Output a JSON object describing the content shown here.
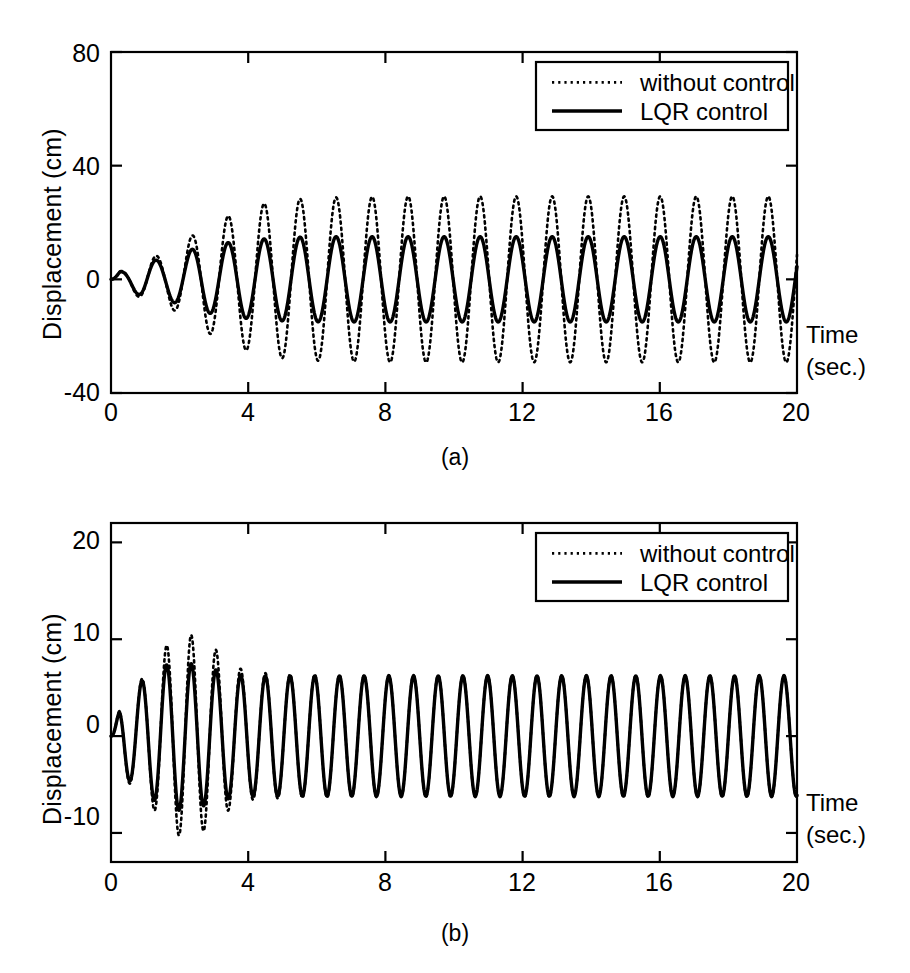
{
  "figure": {
    "panels": [
      {
        "id": "a",
        "caption": "(a)",
        "ylabel": "Displacement (cm)",
        "xlabel_line1": "Time",
        "xlabel_line2": "(sec.)",
        "yticks": [
          "80",
          "40",
          "0",
          "-40"
        ],
        "xticks": [
          "0",
          "4",
          "8",
          "12",
          "16",
          "20"
        ],
        "legend": [
          {
            "label": "without control",
            "style": "dotted"
          },
          {
            "label": "LQR control",
            "style": "solid"
          }
        ]
      },
      {
        "id": "b",
        "caption": "(b)",
        "ylabel": "Displacement (cm)",
        "xlabel_line1": "Time",
        "xlabel_line2": "(sec.)",
        "yticks": [
          "20",
          "10",
          "0",
          "-10"
        ],
        "xticks": [
          "0",
          "4",
          "8",
          "12",
          "16",
          "20"
        ],
        "legend": [
          {
            "label": "without control",
            "style": "dotted"
          },
          {
            "label": "LQR control",
            "style": "solid"
          }
        ]
      }
    ]
  },
  "colors": {
    "ink": "#000000",
    "background": "#ffffff"
  },
  "chart_data": [
    {
      "type": "line",
      "panel": "a",
      "title": "",
      "xlabel": "Time (sec.)",
      "ylabel": "Displacement (cm)",
      "xlim": [
        0,
        20
      ],
      "ylim": [
        -40,
        80
      ],
      "xticks": [
        0,
        4,
        8,
        12,
        16,
        20
      ],
      "yticks": [
        -40,
        0,
        40,
        80
      ],
      "grid": false,
      "legend_position": "top-right",
      "notes": "Top-floor displacement time history; dotted (uncontrolled) grows to a steady amplitude near 29 cm while solid (LQR controlled) saturates near 15 cm. Oscillation period about 1.05 s (~19 cycles in 20 s).",
      "series": [
        {
          "name": "without control",
          "style": "dotted",
          "period_sec": 1.05,
          "envelope_x": [
            0,
            0.5,
            1.0,
            1.6,
            2.1,
            2.6,
            3.2,
            3.7,
            4.2,
            4.8,
            5.3,
            6.3,
            7.4,
            8.4,
            10.5,
            12.6,
            14.7,
            16.8,
            20.0
          ],
          "envelope_amplitude": [
            1.5,
            4.0,
            7.5,
            9.0,
            13.0,
            17.5,
            21.0,
            24.0,
            26.0,
            27.5,
            28.2,
            28.8,
            29.0,
            29.2,
            29.2,
            29.2,
            29.2,
            29.2,
            29.2
          ],
          "peak_values_cm": [
            7.5,
            13.0,
            21.0,
            26.0,
            28.2,
            29.0,
            29.2,
            29.2,
            29.2,
            29.2,
            29.2,
            29.2,
            29.2,
            29.2,
            29.2,
            29.2,
            29.2,
            29.2,
            29.2
          ],
          "trough_values_cm": [
            -4.0,
            -9.0,
            -17.5,
            -24.0,
            -27.5,
            -28.8,
            -29.0,
            -29.2,
            -29.2,
            -29.2,
            -29.2,
            -29.2,
            -29.2,
            -29.2,
            -29.2,
            -29.2,
            -29.2,
            -29.2
          ],
          "steady_state_amplitude_cm": 29.2
        },
        {
          "name": "LQR control",
          "style": "solid",
          "period_sec": 1.05,
          "envelope_x": [
            0,
            0.5,
            1.0,
            1.6,
            2.1,
            2.6,
            3.2,
            3.7,
            4.2,
            4.8,
            5.3,
            6.3,
            7.4,
            8.4,
            10.5,
            12.6,
            14.7,
            16.8,
            20.0
          ],
          "envelope_amplitude": [
            1.5,
            3.5,
            6.5,
            7.0,
            9.5,
            11.5,
            12.5,
            13.5,
            14.0,
            14.5,
            14.8,
            15.0,
            15.0,
            15.0,
            15.0,
            15.0,
            15.0,
            15.0,
            15.0
          ],
          "peak_values_cm": [
            6.5,
            9.5,
            12.5,
            14.0,
            14.8,
            15.0,
            15.0,
            15.0,
            15.0,
            15.0,
            15.0,
            15.0,
            15.0,
            15.0,
            15.0,
            15.0,
            15.0,
            15.0,
            15.0
          ],
          "trough_values_cm": [
            -3.5,
            -7.0,
            -11.5,
            -13.5,
            -14.5,
            -15.0,
            -15.0,
            -15.0,
            -15.0,
            -15.0,
            -15.0,
            -15.0,
            -15.0,
            -15.0,
            -15.0,
            -15.0,
            -15.0,
            -15.0
          ],
          "steady_state_amplitude_cm": 15.0
        }
      ]
    },
    {
      "type": "line",
      "panel": "b",
      "title": "",
      "xlabel": "Time (sec.)",
      "ylabel": "Displacement (cm)",
      "xlim": [
        0,
        20
      ],
      "ylim": [
        -13,
        22
      ],
      "xticks": [
        0,
        4,
        8,
        12,
        16,
        20
      ],
      "yticks": [
        -10,
        0,
        10,
        20
      ],
      "grid": false,
      "legend_position": "top-right",
      "notes": "Base/first-floor displacement; dotted (uncontrolled) overshoots to about 10 cm near t=1.8-2.6 s then settles to about 6.3 cm, nearly coincident with the solid LQR curve which peaks near 7.7 cm and settles near 6.2 cm. Period about 0.72 s (~28 cycles in 20 s).",
      "series": [
        {
          "name": "without control",
          "style": "dotted",
          "period_sec": 0.72,
          "envelope_x": [
            0,
            0.4,
            1.0,
            1.5,
            1.9,
            2.3,
            2.7,
            3.1,
            3.5,
            4.0,
            5.0,
            7.0,
            10.0,
            14.0,
            20.0
          ],
          "envelope_amplitude": [
            1.0,
            4.5,
            6.2,
            9.0,
            10.2,
            10.5,
            9.8,
            8.8,
            7.4,
            6.6,
            6.4,
            6.3,
            6.3,
            6.3,
            6.3
          ],
          "peak_values_cm": [
            6.2,
            10.2,
            9.8,
            7.4,
            6.4,
            6.3,
            6.3,
            6.3,
            6.3,
            6.3,
            6.3,
            6.3,
            6.3,
            6.3
          ],
          "trough_values_cm": [
            -4.5,
            -9.0,
            -10.5,
            -8.8,
            -6.6,
            -6.3,
            -6.3,
            -6.3,
            -6.3,
            -6.3,
            -6.3,
            -6.3,
            -6.3,
            -6.3
          ],
          "steady_state_amplitude_cm": 6.3
        },
        {
          "name": "LQR control",
          "style": "solid",
          "period_sec": 0.72,
          "envelope_x": [
            0,
            0.4,
            1.0,
            1.5,
            1.9,
            2.3,
            2.7,
            3.1,
            3.5,
            4.0,
            5.0,
            7.0,
            10.0,
            14.0,
            20.0
          ],
          "envelope_amplitude": [
            1.0,
            4.2,
            6.0,
            7.2,
            7.7,
            7.5,
            7.2,
            6.8,
            6.4,
            6.2,
            6.2,
            6.2,
            6.2,
            6.2,
            6.2
          ],
          "peak_values_cm": [
            6.0,
            7.7,
            7.2,
            6.4,
            6.2,
            6.2,
            6.2,
            6.2,
            6.2,
            6.2,
            6.2,
            6.2,
            6.2,
            6.2
          ],
          "trough_values_cm": [
            -4.2,
            -7.2,
            -7.5,
            -6.8,
            -6.2,
            -6.2,
            -6.2,
            -6.2,
            -6.2,
            -6.2,
            -6.2,
            -6.2,
            -6.2,
            -6.2
          ],
          "steady_state_amplitude_cm": 6.2
        }
      ]
    }
  ]
}
